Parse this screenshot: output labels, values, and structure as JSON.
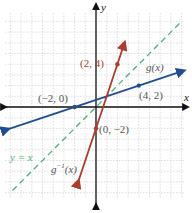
{
  "chart_data": {
    "type": "line",
    "title": "",
    "xlabel": "x",
    "ylabel": "y",
    "xlim": [
      -8.5,
      8.2
    ],
    "ylim": [
      -8.4,
      8.8
    ],
    "grid": true,
    "legend": "inline labels",
    "series": [
      {
        "name": "g(x)",
        "color": "#1f4e96",
        "style": "solid",
        "equation": "y = x/3 + 2/3",
        "points": [
          {
            "x": -2,
            "y": 0
          },
          {
            "x": 4,
            "y": 2
          }
        ],
        "x_range": [
          -8.4,
          8.0
        ]
      },
      {
        "name": "g^-1(x)",
        "color": "#b03a2e",
        "style": "solid",
        "equation": "y = 3x - 2",
        "points": [
          {
            "x": 0,
            "y": -2
          },
          {
            "x": 2,
            "y": 4
          }
        ],
        "x_range": [
          -1.7,
          2.6
        ]
      },
      {
        "name": "y = x",
        "color": "#4fae7a",
        "style": "dashed",
        "equation": "y = x",
        "x_range": [
          -7.8,
          7.8
        ]
      }
    ],
    "annotations": [
      {
        "text": "(-2, 0)",
        "x": -2,
        "y": 0
      },
      {
        "text": "(4, 2)",
        "x": 4,
        "y": 2
      },
      {
        "text": "(2, 4)",
        "x": 2,
        "y": 4
      },
      {
        "text": "(0, -2)",
        "x": 0,
        "y": -2
      }
    ]
  },
  "labels": {
    "x_axis": "x",
    "y_axis": "y",
    "g": "g(x)",
    "g_inv": "g",
    "g_inv_sup": "−1",
    "g_inv_arg": "(x)",
    "identity": "y = x",
    "pt_neg2_0": "(−2, 0)",
    "pt_4_2": "(4, 2)",
    "pt_2_4": "(2, 4)",
    "pt_0_neg2": "(0, −2)"
  },
  "colors": {
    "g": "#1f4e96",
    "g_inv": "#b03a2e",
    "identity": "#4fae7a",
    "axis": "#111111",
    "grid": "#c8c8c8",
    "label_text": "#555555"
  }
}
